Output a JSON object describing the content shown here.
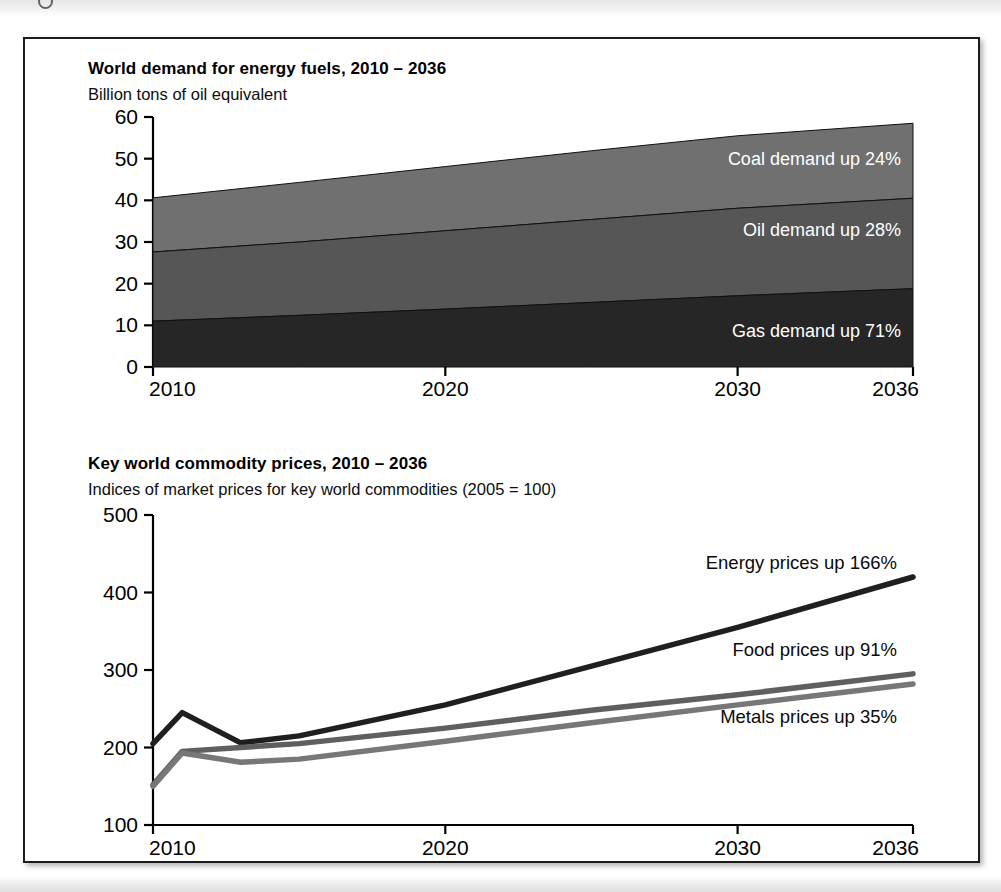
{
  "page": {
    "background": "#ffffff",
    "frame_border_color": "#1c1c1c"
  },
  "panels": [
    {
      "id": "energy-demand",
      "title": "World demand for energy fuels, 2010 – 2036",
      "subtitle": "Billion tons of oil equivalent"
    },
    {
      "id": "commodity-prices",
      "title": "Key world commodity prices, 2010 – 2036",
      "subtitle": "Indices of market prices for key world commodities (2005 = 100)"
    }
  ],
  "chart_data": [
    {
      "type": "area",
      "id": "energy-demand",
      "title": "World demand for energy fuels, 2010 – 2036",
      "subtitle": "Billion tons of oil equivalent",
      "xlabel": "",
      "ylabel": "Billion tons of oil equivalent",
      "stacked": true,
      "grid": false,
      "legend_position": "inline-band-labels",
      "xlim": [
        2010,
        2036
      ],
      "ylim": [
        0,
        60
      ],
      "xticks": [
        2010,
        2020,
        2030,
        2036
      ],
      "xticklabels": [
        "2010",
        "2020",
        "2030",
        "2036"
      ],
      "yticks": [
        0,
        10,
        20,
        30,
        40,
        50,
        60
      ],
      "yticklabels": [
        "0",
        "10",
        "20",
        "30",
        "40",
        "50",
        "60"
      ],
      "x": [
        2010,
        2015,
        2020,
        2025,
        2030,
        2036
      ],
      "series": [
        {
          "name": "Gas",
          "label": "Gas demand up 71%",
          "color": "#262626",
          "values": [
            11.0,
            12.4,
            13.9,
            15.5,
            17.1,
            18.8
          ]
        },
        {
          "name": "Oil",
          "label": "Oil demand up 28%",
          "color": "#565656",
          "values": [
            16.6,
            17.6,
            18.8,
            19.9,
            21.0,
            21.7
          ]
        },
        {
          "name": "Coal",
          "label": "Coal demand up 24%",
          "color": "#707070",
          "values": [
            13.0,
            14.3,
            15.4,
            16.5,
            17.4,
            18.0
          ]
        }
      ],
      "cumulative_tops": {
        "gas": [
          11.0,
          12.4,
          13.9,
          15.5,
          17.1,
          18.8
        ],
        "oil": [
          27.6,
          30.0,
          32.7,
          35.4,
          38.1,
          40.5
        ],
        "coal": [
          40.6,
          44.3,
          48.1,
          51.9,
          55.5,
          58.5
        ]
      },
      "annotations": [
        {
          "text": "Coal demand up 24%",
          "series": "Coal",
          "change_percent": 24
        },
        {
          "text": "Oil demand up 28%",
          "series": "Oil",
          "change_percent": 28
        },
        {
          "text": "Gas demand up 71%",
          "series": "Gas",
          "change_percent": 71
        }
      ]
    },
    {
      "type": "line",
      "id": "commodity-prices",
      "title": "Key world commodity prices, 2010 – 2036",
      "subtitle": "Indices of market prices for key world commodities (2005 = 100)",
      "xlabel": "",
      "ylabel": "Index (2005 = 100)",
      "grid": false,
      "legend_position": "inline-end-labels",
      "xlim": [
        2010,
        2036
      ],
      "ylim": [
        100,
        500
      ],
      "xticks": [
        2010,
        2020,
        2030,
        2036
      ],
      "xticklabels": [
        "2010",
        "2020",
        "2030",
        "2036"
      ],
      "yticks": [
        100,
        200,
        300,
        400,
        500
      ],
      "yticklabels": [
        "100",
        "200",
        "300",
        "400",
        "500"
      ],
      "x": [
        2010,
        2011,
        2013,
        2015,
        2020,
        2025,
        2030,
        2036
      ],
      "series": [
        {
          "name": "Energy",
          "label": "Energy prices up 166%",
          "color": "#1f1f1f",
          "change_percent": 166,
          "values": [
            205,
            245,
            206,
            215,
            255,
            305,
            355,
            420
          ]
        },
        {
          "name": "Food",
          "label": "Food prices up 91%",
          "color": "#5f5f5f",
          "change_percent": 91,
          "values": [
            152,
            195,
            200,
            205,
            225,
            248,
            268,
            295
          ]
        },
        {
          "name": "Metals",
          "label": "Metals prices up 35%",
          "color": "#777777",
          "change_percent": 35,
          "values": [
            150,
            193,
            181,
            185,
            208,
            232,
            255,
            282
          ]
        }
      ],
      "annotations": [
        {
          "text": "Energy prices up 166%",
          "series": "Energy"
        },
        {
          "text": "Food prices up 91%",
          "series": "Food"
        },
        {
          "text": "Metals prices up 35%",
          "series": "Metals"
        }
      ]
    }
  ]
}
